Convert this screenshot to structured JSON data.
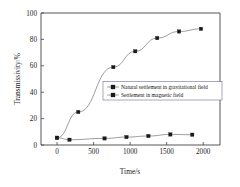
{
  "chart_data": {
    "type": "line",
    "title": "",
    "xlabel": "Time/s",
    "ylabel": "Transmissivity/%",
    "xlim": [
      -220,
      2230
    ],
    "ylim": [
      0,
      100
    ],
    "xticks": [
      0,
      500,
      1000,
      1500,
      2000
    ],
    "yticks": [
      0,
      20,
      40,
      60,
      80,
      100
    ],
    "grid": false,
    "legend_position": "center-right",
    "marker": "filled-square",
    "line_color": "#8a8a8a",
    "marker_color": "#1a1a1a",
    "series": [
      {
        "name": "Natural settlement in gravitational field",
        "x": [
          0,
          290,
          770,
          1070,
          1370,
          1670,
          1970
        ],
        "values": [
          5.5,
          25.0,
          59.0,
          71.0,
          81.0,
          86.0,
          88.0
        ]
      },
      {
        "name": "Settlement in magnetic field",
        "x": [
          0,
          170,
          650,
          950,
          1250,
          1550,
          1850
        ],
        "values": [
          5.5,
          4.0,
          5.0,
          6.0,
          6.8,
          8.0,
          7.8
        ]
      }
    ]
  },
  "axes": {
    "x_tick_labels": [
      "0",
      "500",
      "1000",
      "1500",
      "2000"
    ],
    "y_tick_labels": [
      "0",
      "20",
      "40",
      "60",
      "80",
      "100"
    ],
    "x_axis_title": "Time/s",
    "y_axis_title": "Transmissivity/%"
  },
  "legend": {
    "entries": [
      {
        "label": "Natural settlement in gravitational field"
      },
      {
        "label": "Settlement in magnetic field"
      }
    ]
  }
}
